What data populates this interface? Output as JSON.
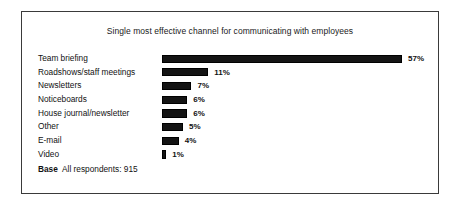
{
  "chart_data": {
    "type": "bar",
    "orientation": "horizontal",
    "title": "Single most effective channel for communicating with employees",
    "xlabel": "",
    "ylabel": "",
    "xlim": [
      0,
      57
    ],
    "grid": false,
    "legend": null,
    "categories": [
      "Team briefing",
      "Roadshows/staff meetings",
      "Newsletters",
      "Noticeboards",
      "House journal/newsletter",
      "Other",
      "E-mail",
      "Video"
    ],
    "values": [
      57,
      11,
      7,
      6,
      6,
      5,
      4,
      1
    ],
    "value_labels": [
      "57%",
      "11%",
      "7%",
      "6%",
      "6%",
      "5%",
      "4%",
      "1%"
    ],
    "bar_color": "#141414",
    "annotations": {
      "base_keyword": "Base",
      "base_text": "All respondents: 915"
    }
  }
}
